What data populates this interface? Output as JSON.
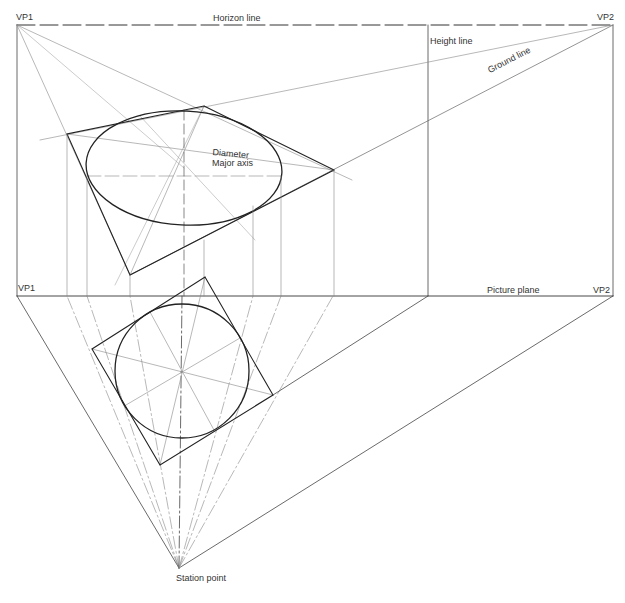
{
  "diagram": {
    "type": "two-point perspective construction of a circle",
    "labels": {
      "vp1_top": "VP1",
      "vp2_top": "VP2",
      "horizon": "Horizon line",
      "height": "Height line",
      "ground": "Ground line",
      "diameter": "Diameter",
      "major_axis": "Major axis",
      "vp1_plan": "VP1",
      "vp2_plan": "VP2",
      "picture_plane": "Picture plane",
      "station_point": "Station point"
    },
    "points": {
      "vp1": [
        17,
        25
      ],
      "vp2": [
        613,
        25
      ],
      "vp1_plan": [
        17,
        296
      ],
      "vp2_plan": [
        613,
        296
      ],
      "height_line_x": 428,
      "station_point": [
        179,
        568
      ],
      "plan_circle_center": [
        182,
        371
      ],
      "plan_circle_radius": 67,
      "plan_square": [
        [
          205,
          277
        ],
        [
          273,
          395
        ],
        [
          160,
          465
        ],
        [
          92,
          349
        ]
      ],
      "persp_square": [
        [
          204,
          106
        ],
        [
          334,
          170
        ],
        [
          130,
          275
        ],
        [
          67,
          134
        ]
      ],
      "ellipse_center": [
        184,
        168
      ],
      "ellipse_rx": 98,
      "ellipse_ry": 57
    },
    "colors": {
      "line_dark": "#222222",
      "line_light": "#888888"
    }
  }
}
